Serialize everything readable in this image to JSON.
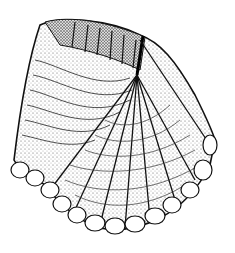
{
  "figure": {
    "background": "#ffffff",
    "ink": "#1a1a1a"
  }
}
